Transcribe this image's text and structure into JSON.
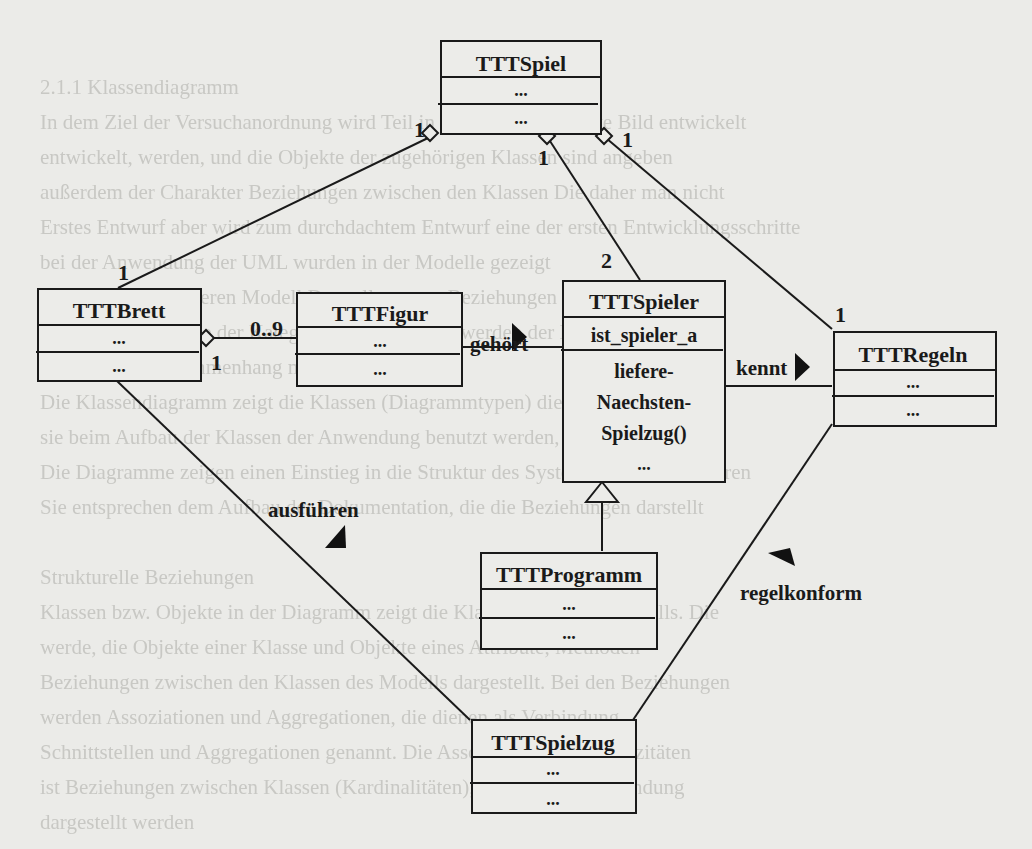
{
  "background_text_lines": [
    "",
    "",
    "2.1.1 Klassendiagramm",
    "In dem Ziel der Versuchanordnung wird Teil in das objektorientierte Bild entwickelt",
    "entwickelt, werden, und die Objekte der zugehörigen Klassen sind angeben",
    "außerdem der Charakter Beziehungen zwischen den Klassen Die daher man nicht",
    "Erstes Entwurf aber wird zum durchdachtem Entwurf eine der ersten Entwicklungsschritte",
    "bei der Anwendung der UML wurden in der Modelle gezeigt",
    "die UML kann in deren Modell Darstellung von Beziehungen in der Kontext",
    "Konstruktionen, wie der Kategorien nicht gezeigt werden der Diagramm",
    "Klassen und Zusammenhang mit den Kategorien",
    "Die Klassendiagramm zeigt die Klassen (Diagrammtypen) die Vererbung, wie",
    "sie beim Aufbau der Klassen der Anwendung benutzt werden, darstellen können",
    "Die Diagramme zeigen einen Einstieg in die Struktur des Systems mit den Verfahren",
    "Sie entsprechen dem Aufbau der Dokumentation, die die Beziehungen darstellt",
    "",
    "Strukturelle Beziehungen",
    "Klassen bzw. Objekte in der Diagramm zeigt die Klassen des UML Modells. Die",
    "werde, die Objekte einer Klasse und Objekte eines Attribute, Methoden",
    "Beziehungen zwischen den Klassen des Modells dargestellt. Bei den Beziehungen",
    "werden Assoziationen und Aggregationen, die dienen als Verbindung",
    "Schnittstellen und Aggregationen genannt. Die Assoziationen, Multiplizitäten",
    "ist Beziehungen zwischen Klassen (Kardinalitäten), die eine der Anwendung",
    "dargestellt werden"
  ],
  "diagram": {
    "type": "UML class diagram",
    "classes": {
      "spiel": {
        "name": "TTTSpiel",
        "attributes": [
          "..."
        ],
        "operations": [
          "..."
        ]
      },
      "brett": {
        "name": "TTTBrett",
        "attributes": [
          "..."
        ],
        "operations": [
          "..."
        ]
      },
      "figur": {
        "name": "TTTFigur",
        "attributes": [
          "..."
        ],
        "operations": [
          "..."
        ]
      },
      "spieler": {
        "name": "TTTSpieler",
        "attributes": [
          "ist_spieler_a"
        ],
        "operations": [
          "liefere-",
          "Naechsten-",
          "Spielzug()",
          "..."
        ]
      },
      "regeln": {
        "name": "TTTRegeln",
        "attributes": [
          "..."
        ],
        "operations": [
          "..."
        ]
      },
      "programm": {
        "name": "TTTProgramm",
        "attributes": [
          "..."
        ],
        "operations": [
          "..."
        ]
      },
      "spielzug": {
        "name": "TTTSpielzug",
        "attributes": [
          "..."
        ],
        "operations": [
          "..."
        ]
      }
    },
    "relations": {
      "spiel_brett": {
        "kind": "aggregation",
        "mult_whole": "1",
        "mult_part": "1"
      },
      "spiel_spieler": {
        "kind": "aggregation",
        "mult_whole": "1",
        "mult_part": "2"
      },
      "spiel_regeln": {
        "kind": "aggregation",
        "mult_whole": "1",
        "mult_part": "1"
      },
      "brett_figur": {
        "kind": "aggregation",
        "mult_whole": "1",
        "mult_part": "0..9"
      },
      "figur_spieler": {
        "kind": "association",
        "label": "gehört"
      },
      "spieler_regeln": {
        "kind": "association",
        "label": "kennt"
      },
      "brett_spielzug": {
        "kind": "association",
        "label": "ausführen"
      },
      "spielzug_regeln": {
        "kind": "association",
        "label": "regelkonform"
      },
      "programm_spieler": {
        "kind": "generalization"
      }
    }
  }
}
